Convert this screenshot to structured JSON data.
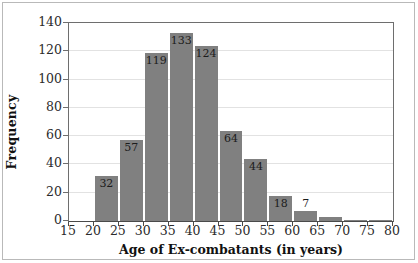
{
  "chart_data": {
    "type": "bar",
    "title": "",
    "subtitle": "",
    "xlabel": "Age of Ex-combatants (in years)",
    "ylabel": "Frequency",
    "xlim": [
      15,
      80
    ],
    "ylim": [
      0,
      140
    ],
    "grid": true,
    "legend": null,
    "bar_color": "#808080",
    "bin_width": 5,
    "x_ticks": [
      15,
      20,
      25,
      30,
      35,
      40,
      45,
      50,
      55,
      60,
      65,
      70,
      75,
      80
    ],
    "x_tick_labels": [
      "15",
      "20",
      "25",
      "30",
      "35",
      "40",
      "45",
      "50",
      "55",
      "60",
      "65",
      "70",
      "75",
      "80"
    ],
    "y_ticks": [
      0,
      20,
      40,
      60,
      80,
      100,
      120,
      140
    ],
    "y_tick_labels": [
      "0",
      "20",
      "40",
      "60",
      "80",
      "100",
      "120",
      "140"
    ],
    "categories": [
      "15-20",
      "20-25",
      "25-30",
      "30-35",
      "35-40",
      "40-45",
      "45-50",
      "50-55",
      "55-60",
      "60-65",
      "65-70",
      "70-75",
      "75-80"
    ],
    "values": [
      0,
      32,
      57,
      119,
      133,
      124,
      64,
      44,
      18,
      7,
      3,
      1,
      1
    ],
    "bar_labels": [
      "",
      "32",
      "57",
      "119",
      "133",
      "124",
      "64",
      "44",
      "18",
      "7",
      "",
      "",
      ""
    ],
    "bins": [
      {
        "start": 15,
        "end": 20,
        "value": 0,
        "label": ""
      },
      {
        "start": 20,
        "end": 25,
        "value": 32,
        "label": "32"
      },
      {
        "start": 25,
        "end": 30,
        "value": 57,
        "label": "57"
      },
      {
        "start": 30,
        "end": 35,
        "value": 119,
        "label": "119"
      },
      {
        "start": 35,
        "end": 40,
        "value": 133,
        "label": "133"
      },
      {
        "start": 40,
        "end": 45,
        "value": 124,
        "label": "124"
      },
      {
        "start": 45,
        "end": 50,
        "value": 64,
        "label": "64"
      },
      {
        "start": 50,
        "end": 55,
        "value": 44,
        "label": "44"
      },
      {
        "start": 55,
        "end": 60,
        "value": 18,
        "label": "18"
      },
      {
        "start": 60,
        "end": 65,
        "value": 7,
        "label": "7"
      },
      {
        "start": 65,
        "end": 70,
        "value": 3,
        "label": ""
      },
      {
        "start": 70,
        "end": 75,
        "value": 1,
        "label": ""
      },
      {
        "start": 75,
        "end": 80,
        "value": 1,
        "label": ""
      }
    ]
  }
}
